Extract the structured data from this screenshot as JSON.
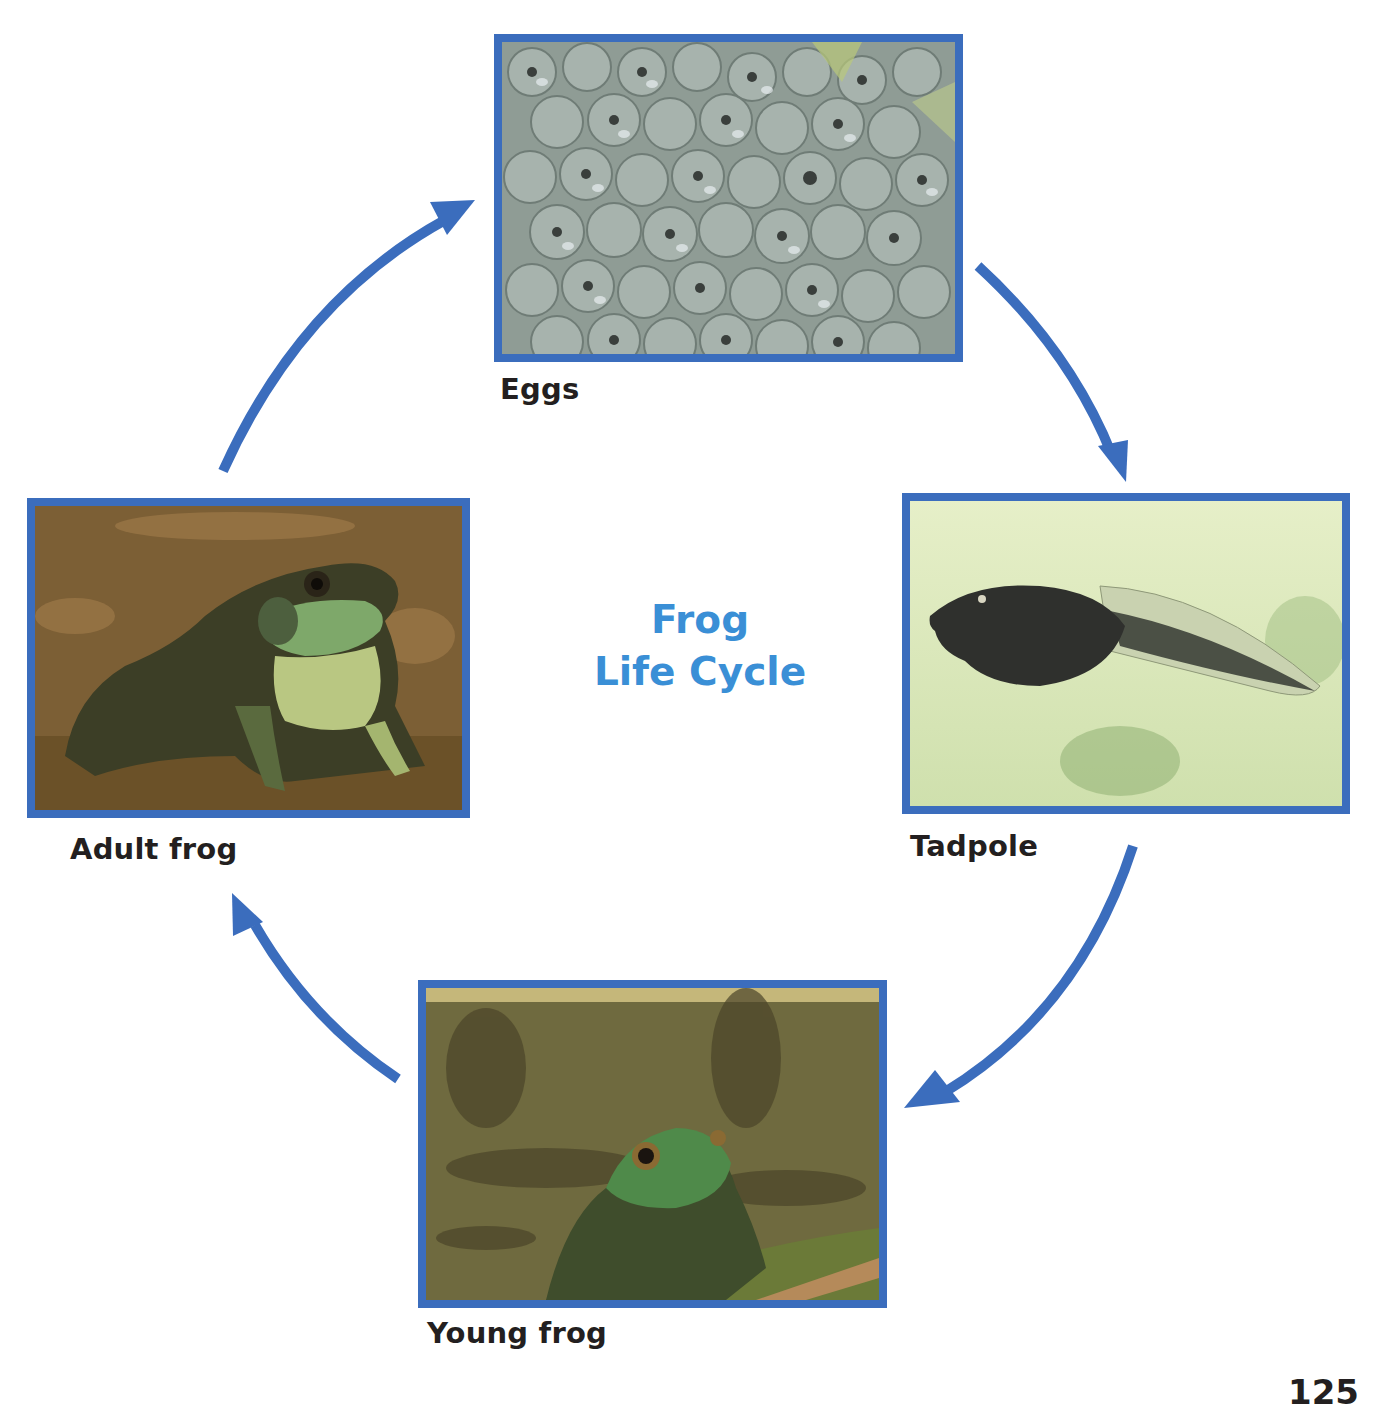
{
  "diagram": {
    "title_line1": "Frog",
    "title_line2": "Life Cycle",
    "accent_color": "#3b6dbd",
    "title_color": "#3a8fd6",
    "stages": [
      {
        "id": "eggs",
        "label": "Eggs",
        "image": "frog-eggs-photo"
      },
      {
        "id": "tadpole",
        "label": "Tadpole",
        "image": "tadpole-photo"
      },
      {
        "id": "young-frog",
        "label": "Young frog",
        "image": "young-frog-photo"
      },
      {
        "id": "adult-frog",
        "label": "Adult frog",
        "image": "adult-frog-photo"
      }
    ],
    "arrows": [
      {
        "from": "eggs",
        "to": "tadpole"
      },
      {
        "from": "tadpole",
        "to": "young-frog"
      },
      {
        "from": "young-frog",
        "to": "adult-frog"
      },
      {
        "from": "adult-frog",
        "to": "eggs"
      }
    ]
  },
  "page": {
    "number": "125"
  }
}
